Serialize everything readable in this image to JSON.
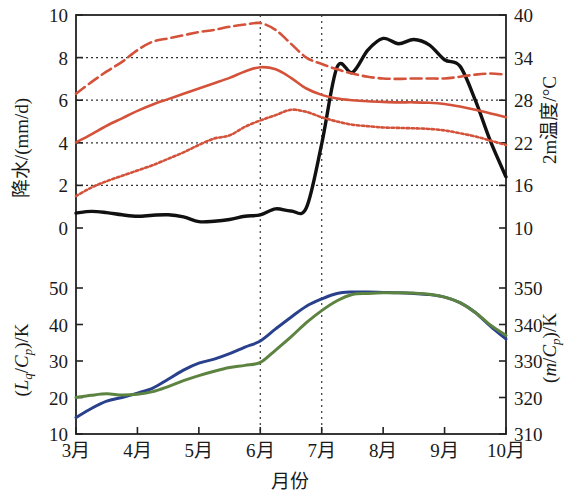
{
  "figure": {
    "xlabel": "月份",
    "left_axis_top_title": "降水/(mm/d)",
    "left_axis_bottom_title": "(Lq/Cp)/K",
    "right_axis_top_title": "2m温度/°C",
    "right_axis_bottom_title": "(m/Cp)/K",
    "colors": {
      "precip_black": "#111111",
      "temp_red": "#d4523a",
      "lq_blue": "#29408c",
      "m_green": "#5d8341",
      "frame": "#222222",
      "grid": "#333333",
      "background": "#ffffff"
    }
  },
  "chart_data": [
    {
      "type": "line",
      "panel": "upper",
      "title": "",
      "xlabel": "月份",
      "ylabel": "降水/(mm/d)",
      "ylabel_right": "2m温度/°C",
      "ylim": [
        0,
        10
      ],
      "ylim_right": [
        10,
        40
      ],
      "yticks": [
        0,
        2,
        4,
        6,
        8,
        10
      ],
      "yticks_right": [
        10,
        16,
        22,
        28,
        34,
        40
      ],
      "xlim": [
        "3月",
        "10月"
      ],
      "xticks": [
        "3月",
        "4月",
        "5月",
        "6月",
        "7月",
        "8月",
        "9月",
        "10月"
      ],
      "grid": "horizontal-dotted at 2,4,6,8 ; vertical-dotted at 6月,7月",
      "legend": "none",
      "x_months": [
        3.0,
        3.25,
        3.5,
        3.75,
        4.0,
        4.25,
        4.5,
        4.75,
        5.0,
        5.25,
        5.5,
        5.75,
        6.0,
        6.25,
        6.5,
        6.75,
        7.0,
        7.25,
        7.5,
        7.75,
        8.0,
        8.25,
        8.5,
        8.75,
        9.0,
        9.25,
        9.5,
        9.75,
        10.0
      ],
      "series": [
        {
          "name": "降水 (precipitation, black solid)",
          "color": "#111111",
          "style": "solid",
          "axis": "left",
          "units": "mm/d",
          "values": [
            0.7,
            0.78,
            0.72,
            0.62,
            0.55,
            0.6,
            0.62,
            0.52,
            0.3,
            0.32,
            0.4,
            0.55,
            0.62,
            0.9,
            0.8,
            0.95,
            3.95,
            7.55,
            7.3,
            8.35,
            8.9,
            8.65,
            8.85,
            8.6,
            7.9,
            7.6,
            6.0,
            4.05,
            2.4
          ]
        },
        {
          "name": "2m温度 上界 (red dashed, upper)",
          "color": "#d4523a",
          "style": "dashed",
          "axis": "left-scale",
          "units": "mm/d equivalent",
          "values": [
            6.3,
            6.85,
            7.35,
            7.8,
            8.35,
            8.75,
            8.9,
            9.05,
            9.2,
            9.3,
            9.45,
            9.55,
            9.62,
            9.3,
            8.65,
            8.0,
            7.7,
            7.45,
            7.25,
            7.1,
            7.02,
            7.0,
            7.02,
            7.02,
            7.02,
            7.1,
            7.2,
            7.25,
            7.2
          ]
        },
        {
          "name": "2m温度 平均 (red solid, middle)",
          "color": "#d4523a",
          "style": "solid",
          "axis": "left-scale",
          "units": "mm/d equivalent",
          "values": [
            4.02,
            4.4,
            4.8,
            5.15,
            5.5,
            5.8,
            6.05,
            6.3,
            6.55,
            6.8,
            7.05,
            7.35,
            7.55,
            7.45,
            7.05,
            6.55,
            6.25,
            6.08,
            6.0,
            5.95,
            5.92,
            5.9,
            5.9,
            5.88,
            5.82,
            5.7,
            5.55,
            5.38,
            5.2
          ]
        },
        {
          "name": "2m温度 下界 (red dotted, lower)",
          "color": "#d4523a",
          "style": "dotted",
          "axis": "left-scale",
          "units": "mm/d equivalent",
          "values": [
            1.5,
            1.9,
            2.2,
            2.45,
            2.7,
            2.95,
            3.25,
            3.55,
            3.9,
            4.2,
            4.35,
            4.75,
            5.05,
            5.3,
            5.55,
            5.45,
            5.2,
            5.0,
            4.85,
            4.78,
            4.72,
            4.7,
            4.68,
            4.65,
            4.58,
            4.45,
            4.3,
            4.1,
            3.9
          ]
        }
      ]
    },
    {
      "type": "line",
      "panel": "lower",
      "title": "",
      "xlabel": "月份",
      "ylabel": "(Lq/Cp)/K",
      "ylabel_right": "(m/Cp)/K",
      "ylim": [
        10,
        55
      ],
      "ylim_right": [
        310,
        355
      ],
      "yticks": [
        10,
        20,
        30,
        40,
        50
      ],
      "yticks_right": [
        310,
        320,
        330,
        340,
        350
      ],
      "xticks": [
        "3月",
        "4月",
        "5月",
        "6月",
        "7月",
        "8月",
        "9月",
        "10月"
      ],
      "grid": "vertical-dotted at 6月,7月",
      "legend": "none",
      "x_months": [
        3.0,
        3.25,
        3.5,
        3.75,
        4.0,
        4.25,
        4.5,
        4.75,
        5.0,
        5.25,
        5.5,
        5.75,
        6.0,
        6.25,
        6.5,
        6.75,
        7.0,
        7.25,
        7.5,
        7.75,
        8.0,
        8.25,
        8.5,
        8.75,
        9.0,
        9.25,
        9.5,
        9.75,
        10.0
      ],
      "series": [
        {
          "name": "(Lq/Cp) 蓝线",
          "color": "#29408c",
          "style": "solid",
          "axis": "left",
          "units": "K",
          "values": [
            14.5,
            17.0,
            19.0,
            20.0,
            21.2,
            22.6,
            25.0,
            27.5,
            29.4,
            30.5,
            32.0,
            33.8,
            35.5,
            38.8,
            42.0,
            45.0,
            47.0,
            48.5,
            48.9,
            48.9,
            48.8,
            48.7,
            48.5,
            48.2,
            47.5,
            46.0,
            43.3,
            39.5,
            36.0
          ]
        },
        {
          "name": "(m/Cp) 绿线",
          "color": "#5d8341",
          "style": "solid",
          "axis": "right",
          "units": "K",
          "values": [
            320.0,
            320.6,
            321.0,
            320.7,
            320.9,
            321.6,
            323.0,
            324.6,
            326.0,
            327.2,
            328.2,
            328.8,
            329.6,
            333.0,
            336.6,
            340.5,
            343.8,
            346.5,
            348.2,
            348.5,
            348.7,
            348.7,
            348.6,
            348.3,
            347.5,
            346.0,
            343.3,
            339.8,
            337.0
          ]
        }
      ]
    }
  ]
}
